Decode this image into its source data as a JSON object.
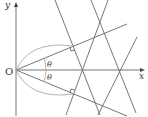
{
  "labels": {
    "origin": "O",
    "x_axis": "x",
    "y_axis": "y",
    "angle_upper": "θ",
    "angle_lower": "θ"
  },
  "colors": {
    "line": "#555555",
    "arc": "#999999",
    "background": "#ffffff"
  }
}
